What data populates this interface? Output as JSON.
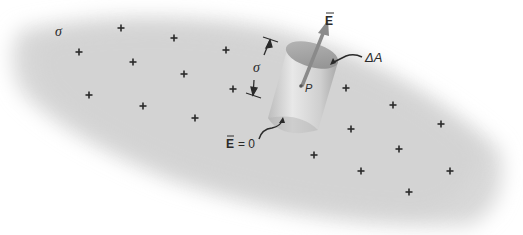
{
  "diagram": {
    "surface_charge_label": "σ",
    "cylinder_height_label": "σ",
    "field_label": "E",
    "area_label": "ΔA",
    "point_label": "P",
    "inside_field_label_E": "E",
    "inside_field_label_eq": "= 0",
    "colors": {
      "surface": "#d6d6d6",
      "cylinder": "#c4c4c4",
      "cylinder_top": "#9e9e9e",
      "arrow": "#8a8a8a",
      "ink": "#2a2a2a"
    },
    "charges": [
      {
        "x": 121,
        "y": 28
      },
      {
        "x": 174,
        "y": 38
      },
      {
        "x": 79,
        "y": 52
      },
      {
        "x": 133,
        "y": 62
      },
      {
        "x": 226,
        "y": 50
      },
      {
        "x": 184,
        "y": 74
      },
      {
        "x": 89,
        "y": 95
      },
      {
        "x": 143,
        "y": 106
      },
      {
        "x": 233,
        "y": 89
      },
      {
        "x": 195,
        "y": 118
      },
      {
        "x": 346,
        "y": 88
      },
      {
        "x": 393,
        "y": 105
      },
      {
        "x": 441,
        "y": 124
      },
      {
        "x": 351,
        "y": 129
      },
      {
        "x": 399,
        "y": 149
      },
      {
        "x": 314,
        "y": 155
      },
      {
        "x": 361,
        "y": 171
      },
      {
        "x": 450,
        "y": 171
      },
      {
        "x": 409,
        "y": 192
      }
    ]
  }
}
